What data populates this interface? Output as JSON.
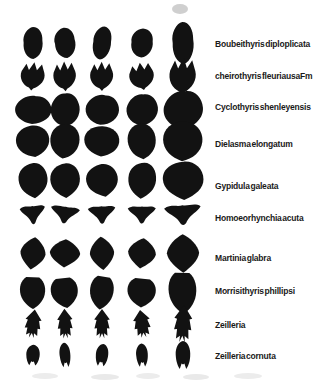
{
  "figure": {
    "background_color": "#ffffff",
    "ink_color": "#121212",
    "label_color": "#1a1a1a",
    "columns_x": [
      33,
      65,
      102,
      142,
      183
    ],
    "large_column_index": 4,
    "large_column_scale": 1.22,
    "label_x": 215,
    "specimens_per_row": 5,
    "rows": [
      {
        "species": "Boubeithyris diploplicata",
        "shape": "lobed-oval",
        "y": 43,
        "rx": 12,
        "ry": 16,
        "label_y": 44
      },
      {
        "species": "cheirothyris fleuriausaFm",
        "shape": "jagged-crown",
        "y": 76,
        "rx": 14,
        "ry": 15,
        "label_y": 76
      },
      {
        "species": "Cyclothyris shenleyensis",
        "shape": "wide-blob",
        "y": 110,
        "rx": 17,
        "ry": 17,
        "label_y": 107
      },
      {
        "species": "Dielasma elongatum",
        "shape": "round-teardrop",
        "y": 141,
        "rx": 17,
        "ry": 17,
        "label_y": 144
      },
      {
        "species": "Gypidula galeata",
        "shape": "round-pointed",
        "y": 180,
        "rx": 16,
        "ry": 18,
        "label_y": 186
      },
      {
        "species": "Homoeorhynchia acuta",
        "shape": "triangle-down",
        "y": 214,
        "rx": 15,
        "ry": 13,
        "label_y": 218
      },
      {
        "species": "Martinia glabra",
        "shape": "rounded-diamond",
        "y": 253,
        "rx": 15,
        "ry": 16,
        "label_y": 258
      },
      {
        "species": "Morrisithyris phillipsi",
        "shape": "pentagon-shield",
        "y": 292,
        "rx": 15,
        "ry": 17,
        "label_y": 291
      },
      {
        "species": "Zeilleria",
        "shape": "arrow-notched",
        "y": 324,
        "rx": 13,
        "ry": 15,
        "label_y": 325
      },
      {
        "species": "Zeilleria cornuta",
        "shape": "small-notched",
        "y": 355,
        "rx": 9.5,
        "ry": 12,
        "label_y": 356
      }
    ]
  }
}
